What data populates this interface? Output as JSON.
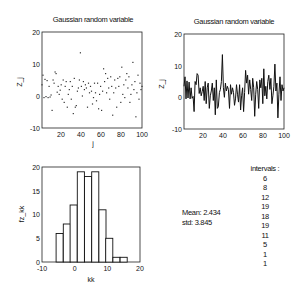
{
  "chart_data": [
    {
      "type": "scatter",
      "title": "Gaussian random variable",
      "xlabel": "j",
      "ylabel": "Z_j",
      "xlim": [
        1,
        100
      ],
      "ylim": [
        -10,
        20
      ],
      "xticks": [
        20,
        40,
        60,
        80,
        100
      ],
      "yticks": [
        -10,
        0,
        10,
        20
      ],
      "grid": false,
      "x": [
        1,
        2,
        3,
        4,
        5,
        6,
        7,
        8,
        9,
        10,
        11,
        12,
        13,
        14,
        15,
        16,
        17,
        18,
        19,
        20,
        21,
        22,
        23,
        24,
        25,
        26,
        27,
        28,
        29,
        30,
        31,
        32,
        33,
        34,
        35,
        36,
        37,
        38,
        39,
        40,
        41,
        42,
        43,
        44,
        45,
        46,
        47,
        48,
        49,
        50,
        51,
        52,
        53,
        54,
        55,
        56,
        57,
        58,
        59,
        60,
        61,
        62,
        63,
        64,
        65,
        66,
        67,
        68,
        69,
        70,
        71,
        72,
        73,
        74,
        75,
        76,
        77,
        78,
        79,
        80,
        81,
        82,
        83,
        84,
        85,
        86,
        87,
        88,
        89,
        90,
        91,
        92,
        93,
        94,
        95,
        96,
        97,
        98,
        99,
        100
      ],
      "values": [
        3.5,
        6.5,
        -0.5,
        5.2,
        -0.2,
        4.8,
        -0.5,
        3.0,
        -0.3,
        0.3,
        -4.5,
        5.0,
        4.0,
        7.5,
        7.0,
        1.2,
        3.0,
        0.5,
        1.8,
        3.5,
        -1.0,
        5.0,
        -2.0,
        3.0,
        4.5,
        -3.5,
        0.5,
        2.0,
        4.5,
        -1.0,
        3.0,
        -5.5,
        5.5,
        -3.5,
        -3.0,
        1.5,
        2.5,
        5.0,
        13.5,
        3.0,
        0.0,
        4.5,
        2.0,
        3.5,
        2.5,
        -3.5,
        4.0,
        1.0,
        3.0,
        1.5,
        -2.5,
        -0.5,
        4.0,
        1.0,
        -1.5,
        4.0,
        -4.0,
        0.5,
        3.0,
        -4.5,
        1.5,
        8.5,
        4.5,
        7.0,
        1.0,
        5.5,
        2.5,
        -1.0,
        6.0,
        3.0,
        -6.0,
        1.0,
        5.0,
        2.5,
        -3.5,
        5.5,
        3.0,
        6.0,
        -2.0,
        9.0,
        0.5,
        3.5,
        -0.5,
        5.0,
        7.0,
        2.5,
        6.0,
        -2.0,
        0.5,
        3.5,
        10.5,
        2.0,
        4.5,
        -6.5,
        1.0,
        6.5,
        -1.0,
        4.0,
        2.0,
        3.0
      ]
    },
    {
      "type": "line",
      "title": "Gaussian random variable",
      "xlabel": "j",
      "ylabel": "Z_j",
      "xlim": [
        1,
        100
      ],
      "ylim": [
        -10,
        20
      ],
      "xticks": [
        20,
        40,
        60,
        80,
        100
      ],
      "yticks": [
        -10,
        0,
        10,
        20
      ],
      "grid": false,
      "series": [
        {
          "name": "Z_j",
          "same_as": "scatter values"
        }
      ]
    },
    {
      "type": "bar",
      "title": "",
      "xlabel": "kk",
      "ylabel": "fz_kk",
      "xlim": [
        -10,
        20
      ],
      "ylim": [
        0,
        20
      ],
      "xticks": [
        -10,
        0,
        10,
        20
      ],
      "yticks": [
        0,
        5,
        10,
        15,
        20
      ],
      "categories": [
        -4.6,
        -2.4,
        -0.3,
        1.9,
        4.1,
        6.3,
        8.5,
        10.6,
        12.8,
        15.0
      ],
      "values": [
        6,
        8,
        12,
        19,
        18,
        19,
        11,
        5,
        1,
        1
      ],
      "grid": false
    }
  ],
  "plots": {
    "scatter": {
      "title": "Gaussian random variable",
      "xlabel": "j",
      "ylabel": "Z_j",
      "yticks": [
        "20",
        "10",
        "0",
        "-10"
      ],
      "xticks": [
        "20",
        "40",
        "60",
        "80",
        "100"
      ]
    },
    "line": {
      "title": "Gaussian random variable",
      "xlabel": "j",
      "ylabel": "Z_j",
      "yticks": [
        "20",
        "10",
        "0",
        "-10"
      ],
      "xticks": [
        "20",
        "40",
        "60",
        "80",
        "100"
      ]
    },
    "hist": {
      "xlabel": "kk",
      "ylabel": "fz_kk",
      "yticks": [
        "20",
        "15",
        "10",
        "5",
        "0"
      ],
      "xticks": [
        "-10",
        "0",
        "10",
        "20"
      ]
    }
  },
  "stats": {
    "mean_label": "Mean: 2.434",
    "std_label": "std: 3.845",
    "intervals_label": "intervals :",
    "intervals": [
      "6",
      "8",
      "12",
      "19",
      "18",
      "19",
      "11",
      "5",
      "1",
      "1"
    ]
  }
}
